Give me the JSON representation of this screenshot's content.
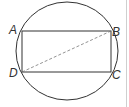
{
  "diagram": {
    "type": "geometry",
    "labels": {
      "A": "A",
      "B": "B",
      "C": "C",
      "D": "D"
    },
    "colors": {
      "stroke": "#333333",
      "dashed": "#777777",
      "border": "#cccccc"
    }
  }
}
